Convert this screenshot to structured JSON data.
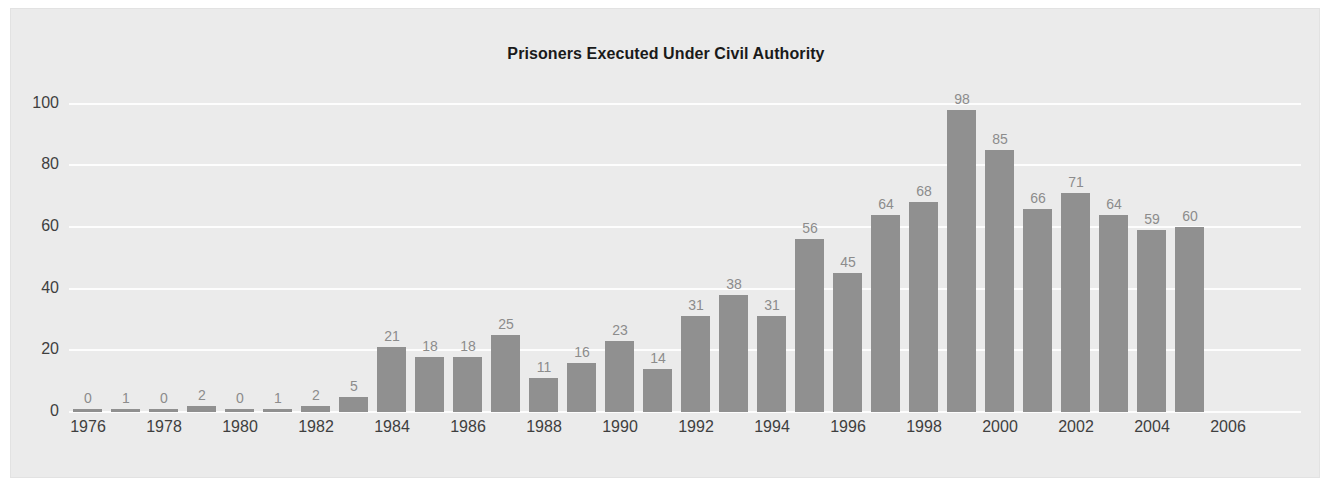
{
  "chart_data": {
    "type": "bar",
    "title": "Prisoners Executed Under Civil Authority",
    "xlabel": "",
    "ylabel": "",
    "categories": [
      "1976",
      "1977",
      "1978",
      "1979",
      "1980",
      "1981",
      "1982",
      "1983",
      "1984",
      "1985",
      "1986",
      "1987",
      "1988",
      "1989",
      "1990",
      "1991",
      "1992",
      "1993",
      "1994",
      "1995",
      "1996",
      "1997",
      "1998",
      "1999",
      "2000",
      "2001",
      "2002",
      "2003",
      "2004",
      "2005"
    ],
    "values": [
      0,
      1,
      0,
      2,
      0,
      1,
      2,
      5,
      21,
      18,
      18,
      25,
      11,
      16,
      23,
      14,
      31,
      38,
      31,
      56,
      45,
      64,
      68,
      98,
      85,
      66,
      71,
      64,
      59,
      60
    ],
    "bar_value_labels": [
      "0",
      "1",
      "0",
      "2",
      "0",
      "1",
      "2",
      "5",
      "21",
      "18",
      "18",
      "25",
      "11",
      "16",
      "23",
      "14",
      "31",
      "38",
      "31",
      "56",
      "45",
      "64",
      "68",
      "98",
      "85",
      "66",
      "71",
      "64",
      "59",
      "60"
    ],
    "ylim": [
      0,
      108
    ],
    "yticks": [
      0,
      20,
      40,
      60,
      80,
      100
    ],
    "ytick_labels": [
      "0",
      "20",
      "40",
      "60",
      "80",
      "100"
    ],
    "xtick_labels": [
      "1976",
      "1978",
      "1980",
      "1982",
      "1984",
      "1986",
      "1988",
      "1990",
      "1992",
      "1994",
      "1996",
      "1998",
      "2000",
      "2002",
      "2004",
      "2006"
    ],
    "xtick_years": [
      1976,
      1978,
      1980,
      1982,
      1984,
      1986,
      1988,
      1990,
      1992,
      1994,
      1996,
      1998,
      2000,
      2002,
      2004,
      2006
    ],
    "grid": true,
    "legend": false,
    "legend_position": "none",
    "colors": {
      "bar": "#909090",
      "panel_background": "#ebebeb",
      "gridline": "#fdfdfd",
      "title_text": "#1a1a1a",
      "axis_text": "#3f3f3f",
      "value_label_text": "#8c8c8c",
      "figure_background": "#ffffff"
    }
  }
}
